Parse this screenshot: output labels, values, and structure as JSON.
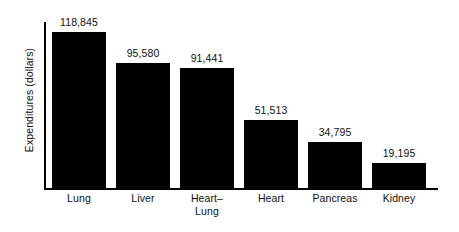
{
  "chart_data": {
    "type": "bar",
    "title": "",
    "xlabel": "",
    "ylabel": "Expenditures (dollars)",
    "categories": [
      "Lung",
      "Liver",
      "Heart–\nLung",
      "Heart",
      "Pancreas",
      "Kidney"
    ],
    "values": [
      118845,
      95580,
      91441,
      51513,
      34795,
      19195
    ],
    "value_labels": [
      "118,845",
      "95,580",
      "91,441",
      "51,513",
      "34,795",
      "19,195"
    ],
    "ylim": [
      0,
      118845
    ],
    "grid": false,
    "legend": null,
    "bar_color": "#000000",
    "axis_color": "#000000",
    "background_color": "#ffffff",
    "text_color": "#111111"
  }
}
